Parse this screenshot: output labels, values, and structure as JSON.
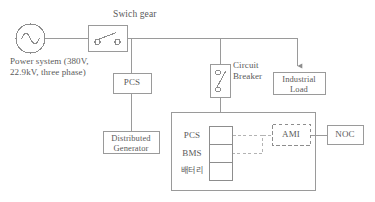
{
  "diagram": {
    "stroke_color": "#9a9a9a",
    "text_color": "#5a5a5a",
    "background": "#ffffff"
  },
  "source": {
    "symbol_name": "ac-source-sine",
    "caption_line1": "Power system (380V,",
    "caption_line2": "22.9kV, three phase)"
  },
  "switchgear": {
    "label": "Swich gear",
    "symbol_name": "switch-contacts"
  },
  "pcs_top": {
    "label": "PCS"
  },
  "circuit_breaker": {
    "label_line1": "Circuit",
    "label_line2": "Breaker",
    "symbol_name": "breaker-contacts"
  },
  "industrial_load": {
    "label_line1": "Industrial",
    "label_line2": "Load"
  },
  "distributed_generator": {
    "label_line1": "Distributed",
    "label_line2": "Generator"
  },
  "ess": {
    "stack": [
      {
        "label": "PCS"
      },
      {
        "label": "BMS"
      },
      {
        "label": "배터리"
      }
    ]
  },
  "ami": {
    "label": "AMI",
    "border": "dashed"
  },
  "noc": {
    "label": "NOC",
    "border": "solid"
  }
}
